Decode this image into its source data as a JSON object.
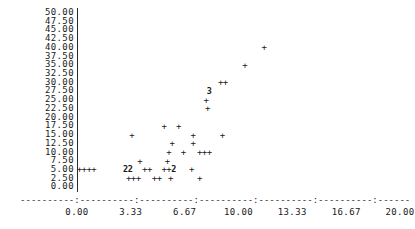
{
  "chart_data": {
    "type": "scatter",
    "title": "",
    "subtitle": "",
    "xlabel": "",
    "ylabel": "",
    "xlim": [
      0.0,
      20.0
    ],
    "ylim": [
      0.0,
      50.0
    ],
    "grid": false,
    "legend": null,
    "marker_glyph": "+",
    "overplot_notation": "digit indicates number of coincident points",
    "x_ticks": [
      {
        "value": 0.0,
        "label": "0.00"
      },
      {
        "value": 3.33,
        "label": "3.33"
      },
      {
        "value": 6.67,
        "label": "6.67"
      },
      {
        "value": 10.0,
        "label": "10.00"
      },
      {
        "value": 13.33,
        "label": "13.33"
      },
      {
        "value": 16.67,
        "label": "16.67"
      },
      {
        "value": 20.0,
        "label": "20.00"
      }
    ],
    "y_ticks": [
      {
        "value": 50.0,
        "label": "50.00"
      },
      {
        "value": 47.5,
        "label": "47.50"
      },
      {
        "value": 45.0,
        "label": "45.00"
      },
      {
        "value": 42.5,
        "label": "42.50"
      },
      {
        "value": 40.0,
        "label": "40.00"
      },
      {
        "value": 37.5,
        "label": "37.50"
      },
      {
        "value": 35.0,
        "label": "35.00"
      },
      {
        "value": 32.5,
        "label": "32.50"
      },
      {
        "value": 30.0,
        "label": "30.00"
      },
      {
        "value": 27.5,
        "label": "27.50"
      },
      {
        "value": 25.0,
        "label": "25.00"
      },
      {
        "value": 22.5,
        "label": "22.50"
      },
      {
        "value": 20.0,
        "label": "20.00"
      },
      {
        "value": 17.5,
        "label": "17.50"
      },
      {
        "value": 15.0,
        "label": "15.00"
      },
      {
        "value": 12.5,
        "label": "12.50"
      },
      {
        "value": 10.0,
        "label": "10.00"
      },
      {
        "value": 7.5,
        "label": "7.50"
      },
      {
        "value": 5.0,
        "label": "5.00"
      },
      {
        "value": 2.5,
        "label": "2.50"
      },
      {
        "value": 0.0,
        "label": "0.00"
      }
    ],
    "points": [
      {
        "x": 11.6,
        "y": 40.0,
        "glyph": "+",
        "count": 1
      },
      {
        "x": 10.4,
        "y": 35.0,
        "glyph": "+",
        "count": 1
      },
      {
        "x": 8.9,
        "y": 30.0,
        "glyph": "+",
        "count": 1
      },
      {
        "x": 9.2,
        "y": 30.0,
        "glyph": "+",
        "count": 1
      },
      {
        "x": 8.2,
        "y": 27.5,
        "glyph": "3",
        "count": 3
      },
      {
        "x": 8.0,
        "y": 25.0,
        "glyph": "+",
        "count": 1
      },
      {
        "x": 8.1,
        "y": 22.5,
        "glyph": "+",
        "count": 1
      },
      {
        "x": 5.4,
        "y": 17.5,
        "glyph": "+",
        "count": 1
      },
      {
        "x": 6.3,
        "y": 17.5,
        "glyph": "+",
        "count": 1
      },
      {
        "x": 3.4,
        "y": 15.0,
        "glyph": "+",
        "count": 1
      },
      {
        "x": 7.2,
        "y": 15.0,
        "glyph": "+",
        "count": 1
      },
      {
        "x": 9.0,
        "y": 15.0,
        "glyph": "+",
        "count": 1
      },
      {
        "x": 5.9,
        "y": 12.5,
        "glyph": "+",
        "count": 1
      },
      {
        "x": 7.2,
        "y": 12.5,
        "glyph": "+",
        "count": 1
      },
      {
        "x": 5.7,
        "y": 10.0,
        "glyph": "+",
        "count": 1
      },
      {
        "x": 6.6,
        "y": 10.0,
        "glyph": "+",
        "count": 1
      },
      {
        "x": 7.6,
        "y": 10.0,
        "glyph": "+",
        "count": 1
      },
      {
        "x": 7.9,
        "y": 10.0,
        "glyph": "+",
        "count": 1
      },
      {
        "x": 8.2,
        "y": 10.0,
        "glyph": "+",
        "count": 1
      },
      {
        "x": 3.9,
        "y": 7.5,
        "glyph": "+",
        "count": 1
      },
      {
        "x": 5.6,
        "y": 7.5,
        "glyph": "+",
        "count": 1
      },
      {
        "x": 0.15,
        "y": 5.0,
        "glyph": "+",
        "count": 1
      },
      {
        "x": 0.45,
        "y": 5.0,
        "glyph": "+",
        "count": 1
      },
      {
        "x": 0.75,
        "y": 5.0,
        "glyph": "+",
        "count": 1
      },
      {
        "x": 1.05,
        "y": 5.0,
        "glyph": "+",
        "count": 1
      },
      {
        "x": 3.0,
        "y": 5.0,
        "glyph": "2",
        "count": 2
      },
      {
        "x": 3.3,
        "y": 5.0,
        "glyph": "2",
        "count": 2
      },
      {
        "x": 4.2,
        "y": 5.0,
        "glyph": "+",
        "count": 1
      },
      {
        "x": 4.5,
        "y": 5.0,
        "glyph": "+",
        "count": 1
      },
      {
        "x": 5.4,
        "y": 5.0,
        "glyph": "+",
        "count": 1
      },
      {
        "x": 5.7,
        "y": 5.0,
        "glyph": "+",
        "count": 1
      },
      {
        "x": 6.0,
        "y": 5.0,
        "glyph": "2",
        "count": 2
      },
      {
        "x": 7.1,
        "y": 5.0,
        "glyph": "+",
        "count": 1
      },
      {
        "x": 3.2,
        "y": 2.5,
        "glyph": "+",
        "count": 1
      },
      {
        "x": 3.5,
        "y": 2.5,
        "glyph": "+",
        "count": 1
      },
      {
        "x": 3.8,
        "y": 2.5,
        "glyph": "+",
        "count": 1
      },
      {
        "x": 4.8,
        "y": 2.5,
        "glyph": "+",
        "count": 1
      },
      {
        "x": 5.1,
        "y": 2.5,
        "glyph": "+",
        "count": 1
      },
      {
        "x": 5.8,
        "y": 2.5,
        "glyph": "+",
        "count": 1
      },
      {
        "x": 7.6,
        "y": 2.5,
        "glyph": "+",
        "count": 1
      }
    ]
  },
  "axis_rendering": {
    "x_axis_dash_char": "-",
    "x_axis_tick_char": ":",
    "y_axis_rule_char": "|"
  }
}
